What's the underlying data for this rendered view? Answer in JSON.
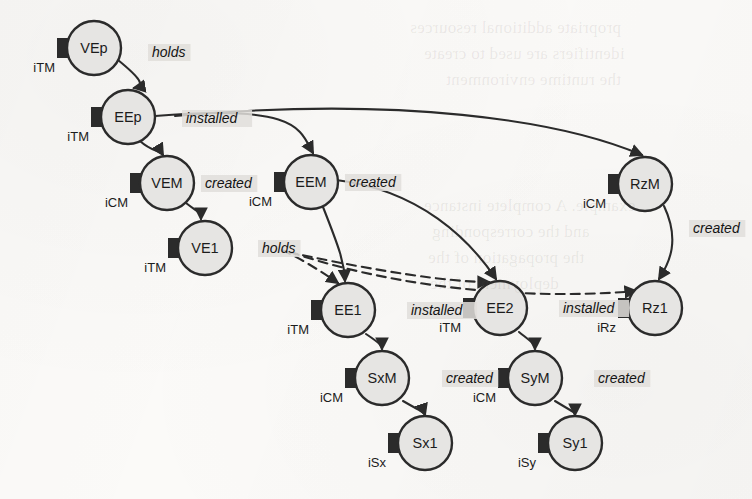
{
  "diagram": {
    "node_fill": "#e6e5e3",
    "node_stroke": "#2b2b2b",
    "connector_color": "#2b2b2b",
    "edge_color": "#2b2b2b",
    "label_highlight": "#e0dedb",
    "nodes": [
      {
        "id": "VEp",
        "label": "VEp",
        "port": "iTM",
        "cx": 94,
        "cy": 48,
        "r": 27
      },
      {
        "id": "EEp",
        "label": "EEp",
        "port": "iTM",
        "cx": 128,
        "cy": 117,
        "r": 27
      },
      {
        "id": "VEM",
        "label": "VEM",
        "port": "iCM",
        "cx": 167,
        "cy": 183,
        "r": 27
      },
      {
        "id": "EEM",
        "label": "EEM",
        "port": "iCM",
        "cx": 311,
        "cy": 182,
        "r": 27
      },
      {
        "id": "RzM",
        "label": "RzM",
        "port": "iCM",
        "cx": 645,
        "cy": 184,
        "r": 27
      },
      {
        "id": "VE1",
        "label": "VE1",
        "port": "iTM",
        "cx": 205,
        "cy": 248,
        "r": 27
      },
      {
        "id": "EE1",
        "label": "EE1",
        "port": "iTM",
        "cx": 348,
        "cy": 310,
        "r": 27
      },
      {
        "id": "EE2",
        "label": "EE2",
        "port": "iTM",
        "cx": 500,
        "cy": 308,
        "r": 27
      },
      {
        "id": "Rz1",
        "label": "Rz1",
        "port": "iRz",
        "cx": 655,
        "cy": 308,
        "r": 27
      },
      {
        "id": "SxM",
        "label": "SxM",
        "port": "iCM",
        "cx": 382,
        "cy": 378,
        "r": 27
      },
      {
        "id": "SyM",
        "label": "SyM",
        "port": "iCM",
        "cx": 535,
        "cy": 378,
        "r": 27
      },
      {
        "id": "Sx1",
        "label": "Sx1",
        "port": "iSx",
        "cx": 425,
        "cy": 443,
        "r": 27
      },
      {
        "id": "Sy1",
        "label": "Sy1",
        "port": "iSy",
        "cx": 575,
        "cy": 443,
        "r": 27
      }
    ],
    "edges": [
      {
        "id": "e1",
        "from": "VEp",
        "to": "EEp",
        "label": "holds",
        "style": "solid",
        "lx": 152,
        "ly": 56
      },
      {
        "id": "e2",
        "from": "EEp",
        "to": "VEM",
        "label": "",
        "style": "solid",
        "lx": 0,
        "ly": 0
      },
      {
        "id": "e3",
        "from": "EEp",
        "to": "EEM",
        "label": "installed",
        "style": "solid",
        "lx": 186,
        "ly": 122
      },
      {
        "id": "e4",
        "from": "EEp",
        "to": "RzM",
        "label": "",
        "style": "solid",
        "lx": 0,
        "ly": 0
      },
      {
        "id": "e5",
        "from": "VEM",
        "to": "VE1",
        "label": "created",
        "style": "solid",
        "lx": 205,
        "ly": 187
      },
      {
        "id": "e6",
        "from": "EEM",
        "to": "EE1",
        "label": "created",
        "style": "solid",
        "lx": 349,
        "ly": 186
      },
      {
        "id": "e7",
        "from": "EEM",
        "to": "EE2",
        "label": "",
        "style": "solid",
        "lx": 0,
        "ly": 0
      },
      {
        "id": "e8",
        "from": "RzM",
        "to": "Rz1",
        "label": "created",
        "style": "solid",
        "lx": 693,
        "ly": 232
      },
      {
        "id": "e9",
        "from": "VE1",
        "to": "EE1",
        "label": "holds",
        "style": "dashed",
        "lx": 262,
        "ly": 252
      },
      {
        "id": "e10",
        "from": "VE1",
        "to": "EE2",
        "label": "",
        "style": "dashed",
        "lx": 0,
        "ly": 0
      },
      {
        "id": "e11",
        "from": "VE1",
        "to": "Rz1",
        "label": "",
        "style": "dashed",
        "lx": 0,
        "ly": 0
      },
      {
        "id": "e12",
        "from": "EE1",
        "to": "SxM",
        "label": "installed",
        "style": "solid",
        "lx": 411,
        "ly": 314
      },
      {
        "id": "e13",
        "from": "EE2",
        "to": "SyM",
        "label": "installed",
        "style": "solid",
        "lx": 563,
        "ly": 312
      },
      {
        "id": "e14",
        "from": "SxM",
        "to": "Sx1",
        "label": "created",
        "style": "solid",
        "lx": 446,
        "ly": 382
      },
      {
        "id": "e15",
        "from": "SyM",
        "to": "Sy1",
        "label": "created",
        "style": "solid",
        "lx": 598,
        "ly": 382
      }
    ],
    "bleed_text": [
      {
        "text": "propriate additional resources",
        "x": 410,
        "y": 18
      },
      {
        "text": "identifiers are used to create",
        "x": 424,
        "y": 44
      },
      {
        "text": "the runtime environment",
        "x": 446,
        "y": 70
      },
      {
        "text": "example. A complete instance",
        "x": 424,
        "y": 196
      },
      {
        "text": "and the corresponding",
        "x": 432,
        "y": 222
      },
      {
        "text": "the propagation of the",
        "x": 428,
        "y": 248
      },
      {
        "text": "deployment of the",
        "x": 430,
        "y": 274
      }
    ]
  }
}
